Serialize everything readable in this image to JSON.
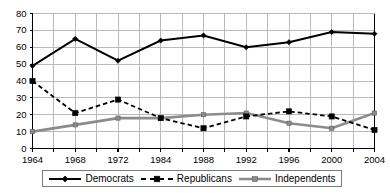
{
  "chart_data": {
    "type": "line",
    "title": "",
    "subtitle": "",
    "xlabel": "",
    "ylabel": "",
    "x": [
      1964,
      1968,
      1972,
      1984,
      1988,
      1992,
      1996,
      2000,
      2004
    ],
    "categories": [
      "1964",
      "1968",
      "1972",
      "1984",
      "1988",
      "1992",
      "1996",
      "2000",
      "2004"
    ],
    "xtick_labels": [
      "1964",
      "1968",
      "1972",
      "1984",
      "1988",
      "1992",
      "1996",
      "2000",
      "2004"
    ],
    "ytick_labels": [
      "0",
      "10",
      "20",
      "30",
      "40",
      "50",
      "60",
      "70",
      "80"
    ],
    "yticks": [
      0,
      10,
      20,
      30,
      40,
      50,
      60,
      70,
      80
    ],
    "ylim": [
      0,
      80
    ],
    "grid": "both",
    "legend_position": "bottom",
    "series": [
      {
        "name": "Democrats",
        "values": [
          49,
          65,
          52,
          64,
          67,
          60,
          63,
          69,
          68
        ],
        "color": "#000000",
        "line_style": "solid",
        "marker": "diamond"
      },
      {
        "name": "Republicans",
        "values": [
          40,
          21,
          29,
          18,
          12,
          19,
          22,
          19,
          11
        ],
        "color": "#000000",
        "line_style": "dashed",
        "marker": "square"
      },
      {
        "name": "Independents",
        "values": [
          10,
          14,
          18,
          18,
          20,
          21,
          15,
          12,
          21
        ],
        "color": "#8c8c8c",
        "line_style": "solid",
        "marker": "square"
      }
    ]
  },
  "legend": {
    "items": [
      {
        "label": "Democrats"
      },
      {
        "label": "Republicans"
      },
      {
        "label": "Independents"
      }
    ]
  },
  "colors": {
    "axis": "#000000",
    "grid": "#b9b9b9",
    "democrats": "#000000",
    "republicans": "#000000",
    "independents": "#8c8c8c",
    "legend_border": "#7a7a7a",
    "background": "#ffffff"
  }
}
